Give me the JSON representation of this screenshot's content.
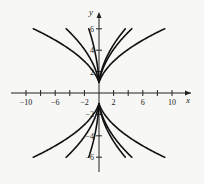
{
  "chart_data": {
    "type": "line",
    "title": "",
    "xlabel": "x",
    "ylabel": "y",
    "xlim": [
      -11.5,
      11.5
    ],
    "ylim": [
      -7,
      8
    ],
    "x_ticks": [
      -10,
      -8,
      -6,
      -4,
      -2,
      2,
      4,
      6,
      8,
      10
    ],
    "x_tick_labels": [
      "-10",
      "-6",
      "-2",
      "2",
      "6",
      "10"
    ],
    "x_tick_label_values": [
      -10,
      -6,
      -2,
      2,
      6,
      10
    ],
    "y_ticks": [
      -6,
      -4,
      -2,
      2,
      4,
      6
    ],
    "y_tick_labels": [
      "6",
      "4",
      "2",
      "-2",
      "-4",
      "-6"
    ],
    "y_tick_label_values": [
      6,
      4,
      2,
      -2,
      -4,
      -6
    ],
    "grid": false,
    "legend": "none",
    "series": [
      {
        "name": "c=-3.9 upper",
        "c": -3.9,
        "branch": 1,
        "x_range": [
          -9,
          0
        ]
      },
      {
        "name": "c=-7.8 upper",
        "c": -7.8,
        "branch": 1,
        "x_range": [
          -4.5,
          0
        ]
      },
      {
        "name": "c=-25 upper",
        "c": -25,
        "branch": 1,
        "x_range": [
          -1.4,
          0
        ]
      },
      {
        "name": "c=9.7 upper",
        "c": 9.7,
        "branch": 1,
        "x_range": [
          0,
          3.6
        ]
      },
      {
        "name": "c=7.8 upper",
        "c": 7.8,
        "branch": 1,
        "x_range": [
          0,
          4.5
        ]
      },
      {
        "name": "c=3.9 upper",
        "c": 3.9,
        "branch": 1,
        "x_range": [
          0,
          9
        ]
      },
      {
        "name": "c=-3.9 lower",
        "c": -3.9,
        "branch": -1,
        "x_range": [
          -9,
          0
        ]
      },
      {
        "name": "c=-7.8 lower",
        "c": -7.8,
        "branch": -1,
        "x_range": [
          -4.5,
          0
        ]
      },
      {
        "name": "c=-25 lower",
        "c": -25,
        "branch": -1,
        "x_range": [
          -1.4,
          0
        ]
      },
      {
        "name": "c=9.7 lower",
        "c": 9.7,
        "branch": -1,
        "x_range": [
          0,
          3.6
        ]
      },
      {
        "name": "c=7.8 lower",
        "c": 7.8,
        "branch": -1,
        "x_range": [
          0,
          4.5
        ]
      },
      {
        "name": "c=3.9 lower",
        "c": 3.9,
        "branch": -1,
        "x_range": [
          0,
          9
        ]
      }
    ]
  }
}
